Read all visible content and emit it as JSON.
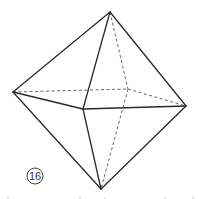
{
  "figure": {
    "type": "octahedron",
    "label": "16",
    "vertices": {
      "top": [
        110,
        12
      ],
      "left": [
        13,
        92
      ],
      "right": [
        186,
        106
      ],
      "front": [
        83,
        109
      ],
      "back": [
        128,
        89
      ],
      "bottom": [
        101,
        189
      ]
    },
    "solid_edges": [
      [
        "top",
        "left"
      ],
      [
        "top",
        "right"
      ],
      [
        "top",
        "front"
      ],
      [
        "left",
        "front"
      ],
      [
        "front",
        "right"
      ],
      [
        "left",
        "bottom"
      ],
      [
        "front",
        "bottom"
      ],
      [
        "right",
        "bottom"
      ]
    ],
    "hidden_edges": [
      [
        "top",
        "back"
      ],
      [
        "left",
        "back"
      ],
      [
        "back",
        "right"
      ],
      [
        "back",
        "bottom"
      ]
    ],
    "colors": {
      "edge": "#2a2a2a",
      "hidden_edge": "#555555",
      "background": "#ffffff"
    }
  }
}
